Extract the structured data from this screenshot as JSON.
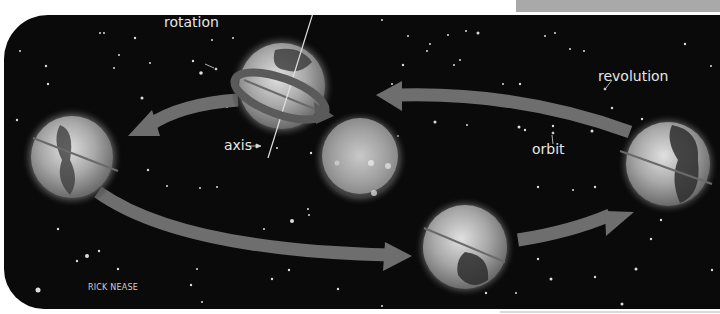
{
  "diagram": {
    "labels": {
      "rotation": "rotation",
      "axis": "axis",
      "orbit": "orbit",
      "revolution": "revolution"
    },
    "credit": "RICK NEASE",
    "elements": [
      {
        "name": "sun",
        "position": "center"
      },
      {
        "name": "earth-top",
        "position": "top-center",
        "note": "with rotation ring"
      },
      {
        "name": "earth-left",
        "position": "left"
      },
      {
        "name": "earth-bottom",
        "position": "bottom-center"
      },
      {
        "name": "earth-right",
        "position": "right"
      }
    ],
    "arrows": [
      {
        "from": "earth-right",
        "to": "earth-top",
        "direction": "counterclockwise"
      },
      {
        "from": "earth-top",
        "to": "earth-left",
        "direction": "counterclockwise"
      },
      {
        "from": "earth-left",
        "to": "earth-bottom",
        "direction": "counterclockwise"
      },
      {
        "from": "earth-bottom",
        "to": "earth-right",
        "direction": "counterclockwise"
      }
    ],
    "colors": {
      "background": "#0a0a0a",
      "arrow": "#6e6e6e",
      "text": "#e6e6e6",
      "sun": "#b5b5b5",
      "top_bar": "#a9a9a9"
    }
  }
}
